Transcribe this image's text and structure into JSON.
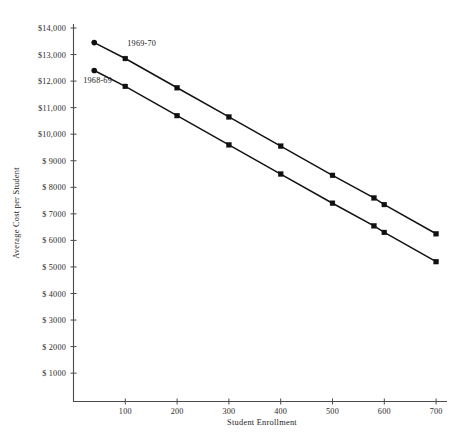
{
  "chart_data": {
    "type": "line",
    "title": "",
    "xlabel": "Student Enrollment",
    "ylabel": "Average Cost per Student",
    "xlim": [
      0,
      715
    ],
    "ylim": [
      0,
      14000
    ],
    "grid": false,
    "legend_position": "inline-labels",
    "x_ticks": [
      100,
      200,
      300,
      400,
      500,
      600,
      700
    ],
    "x_tick_labels": [
      "100",
      "200",
      "300",
      "400",
      "500",
      "600",
      "700"
    ],
    "y_ticks": [
      1000,
      2000,
      3000,
      4000,
      5000,
      6000,
      7000,
      8000,
      9000,
      10000,
      11000,
      12000,
      13000,
      14000
    ],
    "y_tick_labels": [
      "$ 1000",
      "$ 2000",
      "$ 3000",
      "$ 4000",
      "$ 5000",
      "$ 6000",
      "$ 7000",
      "$ 8000",
      "$ 9000",
      "$10,000",
      "$11,000",
      "$12,000",
      "$13,000",
      "$14,000"
    ],
    "series": [
      {
        "name": "1969-70",
        "label": "1969-70",
        "marker": "square",
        "x": [
          40,
          100,
          200,
          300,
          400,
          500,
          580,
          600,
          700
        ],
        "values": [
          13450,
          12850,
          11750,
          10650,
          9550,
          8450,
          7600,
          7350,
          6250
        ],
        "annotation": {
          "text": "1969-70",
          "x": 100,
          "y": 13450
        }
      },
      {
        "name": "1968-69",
        "label": "1968-69",
        "marker": "square",
        "x": [
          40,
          100,
          200,
          300,
          400,
          500,
          580,
          600,
          700
        ],
        "values": [
          12400,
          11800,
          10700,
          9600,
          8500,
          7400,
          6550,
          6300,
          5200
        ],
        "annotation": {
          "text": "1968-69",
          "x": 15,
          "y": 12050
        }
      }
    ]
  },
  "axes": {
    "y_title": "Average Cost per Student",
    "x_title": "Student Enrollment"
  }
}
